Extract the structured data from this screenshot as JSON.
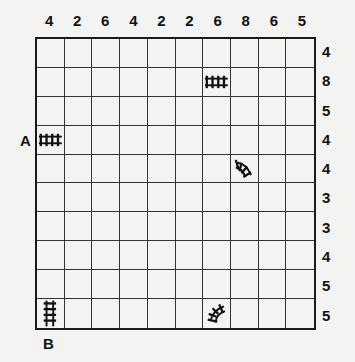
{
  "puzzle": {
    "type": "train-tracks",
    "rows": 10,
    "cols": 10,
    "column_clues": [
      "4",
      "2",
      "6",
      "4",
      "2",
      "2",
      "6",
      "8",
      "6",
      "5"
    ],
    "row_clues": [
      "4",
      "8",
      "5",
      "4",
      "4",
      "3",
      "3",
      "4",
      "5",
      "5"
    ],
    "start_label": "A",
    "end_label": "B",
    "given_tracks": [
      {
        "row": 1,
        "col": 6,
        "piece": "straight-horizontal"
      },
      {
        "row": 3,
        "col": 0,
        "piece": "straight-horizontal"
      },
      {
        "row": 4,
        "col": 7,
        "piece": "curve-a"
      },
      {
        "row": 9,
        "col": 0,
        "piece": "straight-vertical"
      },
      {
        "row": 9,
        "col": 6,
        "piece": "curve-b"
      }
    ],
    "colors": {
      "background": "#f3f3f2",
      "grid_line": "#333333",
      "text": "#111111"
    }
  }
}
